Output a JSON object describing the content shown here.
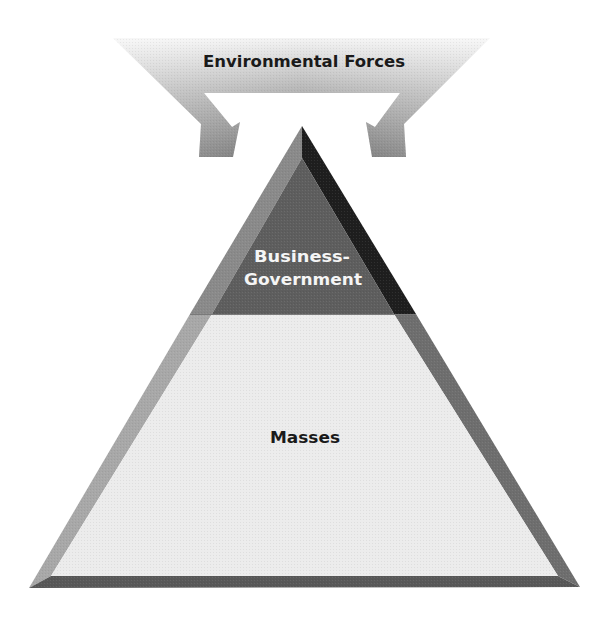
{
  "diagram": {
    "type": "pyramid-with-inflow-arrows",
    "arrow": {
      "label": "Environmental Forces",
      "direction": "down-inward onto pyramid apex",
      "count": 2
    },
    "pyramid": {
      "levels": [
        {
          "id": "top",
          "label_line1": "Business-",
          "label_line2": "Government",
          "shade": "dark"
        },
        {
          "id": "bottom",
          "label": "Masses",
          "shade": "light"
        }
      ]
    },
    "colors": {
      "background": "#ffffff",
      "arrow_light": "#f2f2f2",
      "arrow_dark": "#7a7a7a",
      "top_fill": "#5e5e5e",
      "top_left_bevel": "#8a8a8a",
      "top_right_bevel": "#1e1e1e",
      "bottom_fill": "#ececec",
      "bottom_left_bevel": "#a8a8a8",
      "bottom_right_bevel": "#6e6e6e",
      "base_bevel": "#585858",
      "label_dark_text": "#1a1a1a",
      "label_light_text": "#f5f5f5"
    }
  }
}
